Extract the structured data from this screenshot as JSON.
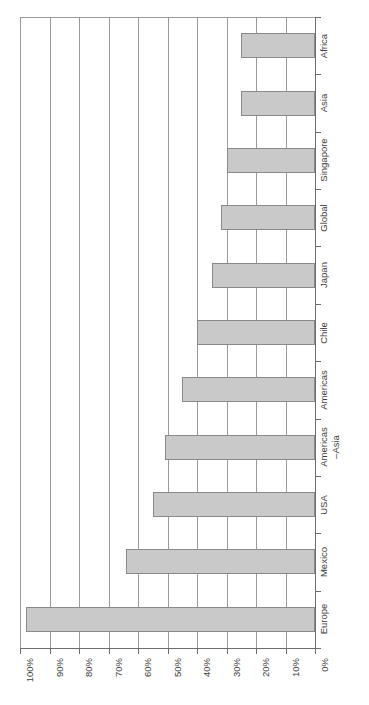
{
  "chart_data": {
    "type": "bar",
    "orientation": "horizontal-rotated",
    "title": "",
    "subtitle": "",
    "xlabel": "",
    "ylabel": "",
    "categories": [
      "Africa",
      "Asia",
      "Singapore",
      "Global",
      "Japan",
      "Chile",
      "Americas",
      "Americas\n–Asia",
      "USA",
      "Mexico",
      "Europe"
    ],
    "values": [
      25,
      25,
      30,
      32,
      35,
      40,
      45,
      51,
      55,
      64,
      98
    ],
    "value_suffix": "%",
    "tick_labels": [
      "100%",
      "90%",
      "80%",
      "70%",
      "60%",
      "50%",
      "40%",
      "30%",
      "20%",
      "10%",
      "0%"
    ],
    "tick_values": [
      100,
      90,
      80,
      70,
      60,
      50,
      40,
      30,
      20,
      10,
      0
    ],
    "axis_range": [
      0,
      100
    ],
    "axis_direction": "reversed",
    "grid": true,
    "grid_axis": "value",
    "legend": false,
    "legend_position": "none",
    "bar_color": "#c9c9c9",
    "bar_border_color": "#8a8a8a",
    "grid_color": "#9a9a9a",
    "axis_color": "#6e6e6e",
    "text_color": "#3d3d3d",
    "background_color": "#ffffff",
    "data_labels": false,
    "annotations": []
  }
}
